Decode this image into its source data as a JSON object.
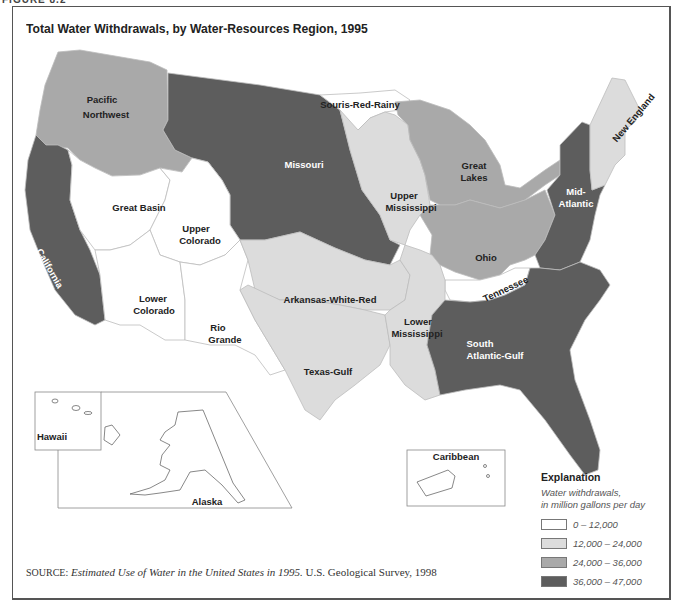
{
  "figure_label": "FIGURE 8.2",
  "title": "Total Water Withdrawals, by Water-Resources Region, 1995",
  "colors": {
    "class_0_12000": "#ffffff",
    "class_12000_24000": "#dcdcdc",
    "class_24000_36000": "#a9a9a9",
    "class_36000_47000": "#5d5d5d",
    "boundary": "#bcbcbc",
    "outline": "#888888"
  },
  "regions": [
    {
      "name": "Pacific Northwest",
      "label_lines": [
        "Pacific",
        "Northwest"
      ],
      "class": "24,000 – 36,000"
    },
    {
      "name": "Missouri",
      "label_lines": [
        "Missouri"
      ],
      "class": "36,000 – 47,000"
    },
    {
      "name": "Souris-Red-Rainy",
      "label_lines": [
        "Souris-Red-Rainy"
      ],
      "class": "0 – 12,000"
    },
    {
      "name": "Great Lakes",
      "label_lines": [
        "Great",
        "Lakes"
      ],
      "class": "24,000 – 36,000"
    },
    {
      "name": "New England",
      "label_lines": [
        "New England"
      ],
      "class": "12,000 – 24,000"
    },
    {
      "name": "Mid-Atlantic",
      "label_lines": [
        "Mid-",
        "Atlantic"
      ],
      "class": "36,000 – 47,000"
    },
    {
      "name": "Upper Mississippi",
      "label_lines": [
        "Upper",
        "Mississippi"
      ],
      "class": "12,000 – 24,000"
    },
    {
      "name": "Ohio",
      "label_lines": [
        "Ohio"
      ],
      "class": "24,000 – 36,000"
    },
    {
      "name": "Tennessee",
      "label_lines": [
        "Tennessee"
      ],
      "class": "0 – 12,000"
    },
    {
      "name": "California",
      "label_lines": [
        "California"
      ],
      "class": "36,000 – 47,000"
    },
    {
      "name": "Great Basin",
      "label_lines": [
        "Great Basin"
      ],
      "class": "0 – 12,000"
    },
    {
      "name": "Upper Colorado",
      "label_lines": [
        "Upper",
        "Colorado"
      ],
      "class": "0 – 12,000"
    },
    {
      "name": "Lower Colorado",
      "label_lines": [
        "Lower",
        "Colorado"
      ],
      "class": "0 – 12,000"
    },
    {
      "name": "Rio Grande",
      "label_lines": [
        "Rio",
        "Grande"
      ],
      "class": "0 – 12,000"
    },
    {
      "name": "Arkansas-White-Red",
      "label_lines": [
        "Arkansas-White-Red"
      ],
      "class": "12,000 – 24,000"
    },
    {
      "name": "Texas-Gulf",
      "label_lines": [
        "Texas-Gulf"
      ],
      "class": "12,000 – 24,000"
    },
    {
      "name": "Lower Mississippi",
      "label_lines": [
        "Lower",
        "Mississippi"
      ],
      "class": "12,000 – 24,000"
    },
    {
      "name": "South Atlantic-Gulf",
      "label_lines": [
        "South",
        "Atlantic-Gulf"
      ],
      "class": "36,000 – 47,000"
    },
    {
      "name": "Hawaii",
      "label_lines": [
        "Hawaii"
      ],
      "class": "0 – 12,000"
    },
    {
      "name": "Alaska",
      "label_lines": [
        "Alaska"
      ],
      "class": "0 – 12,000"
    },
    {
      "name": "Caribbean",
      "label_lines": [
        "Caribbean"
      ],
      "class": "0 – 12,000"
    }
  ],
  "legend": {
    "title": "Explanation",
    "subtitle_line1": "Water withdrawals,",
    "subtitle_line2": "in million gallons per day",
    "items": [
      {
        "label": "0 – 12,000",
        "color": "#ffffff"
      },
      {
        "label": "12,000 – 24,000",
        "color": "#dcdcdc"
      },
      {
        "label": "24,000 – 36,000",
        "color": "#a9a9a9"
      },
      {
        "label": "36,000 – 47,000",
        "color": "#5d5d5d"
      }
    ]
  },
  "source": {
    "prefix": "SOURCE:",
    "title": "Estimated Use of Water in the United States in 1995.",
    "publisher": " U.S. Geological Survey, 1998"
  }
}
